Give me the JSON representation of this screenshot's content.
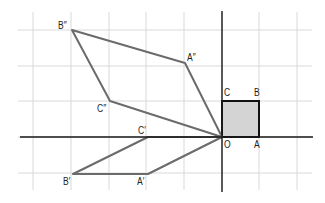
{
  "diagram": {
    "type": "coordinate-grid-transformations",
    "colors": {
      "grid": "#d9d9d9",
      "axis": "#1a1a1a",
      "square_fill": "#d4d4d4",
      "square_stroke": "#111111",
      "image_stroke": "#6b6b6b"
    },
    "grid": {
      "x_lines": [
        33,
        71,
        109,
        146,
        184,
        222,
        259,
        297
      ],
      "y_lines": [
        30,
        66,
        101,
        137,
        173
      ],
      "x_extent": [
        18,
        312
      ],
      "y_extent": [
        12,
        190
      ]
    },
    "axes": {
      "origin": [
        222,
        137
      ],
      "x_axis": {
        "from": [
          20,
          137
        ],
        "to": [
          313,
          137
        ]
      },
      "y_axis": {
        "from": [
          222,
          11
        ],
        "to": [
          222,
          192
        ]
      }
    },
    "shapes": [
      {
        "name": "OABC",
        "kind": "original-square",
        "points": [
          [
            222,
            137
          ],
          [
            259,
            137
          ],
          [
            259,
            101
          ],
          [
            222,
            101
          ]
        ]
      },
      {
        "name": "OA''B''C''",
        "kind": "image-double-prime",
        "points": [
          [
            222,
            137
          ],
          [
            185,
            63
          ],
          [
            72,
            30
          ],
          [
            110,
            101
          ]
        ]
      },
      {
        "name": "OC'B'A'",
        "kind": "image-prime",
        "points": [
          [
            222,
            137
          ],
          [
            148,
            137
          ],
          [
            73,
            174
          ],
          [
            148,
            174
          ]
        ]
      }
    ],
    "labels": [
      {
        "id": "O",
        "text": "O",
        "x": 224,
        "y": 140
      },
      {
        "id": "A",
        "text": "A",
        "x": 254,
        "y": 140
      },
      {
        "id": "B",
        "text": "B",
        "x": 254,
        "y": 88
      },
      {
        "id": "C",
        "text": "C",
        "x": 224,
        "y": 88
      },
      {
        "id": "A2",
        "text": "A″",
        "x": 187,
        "y": 53
      },
      {
        "id": "B2",
        "text": "B″",
        "x": 58,
        "y": 21
      },
      {
        "id": "C2",
        "text": "C″",
        "x": 97,
        "y": 104
      },
      {
        "id": "A1",
        "text": "A′",
        "x": 137,
        "y": 177
      },
      {
        "id": "B1",
        "text": "B′",
        "x": 63,
        "y": 177
      },
      {
        "id": "C1",
        "text": "C′",
        "x": 138,
        "y": 126
      }
    ]
  }
}
